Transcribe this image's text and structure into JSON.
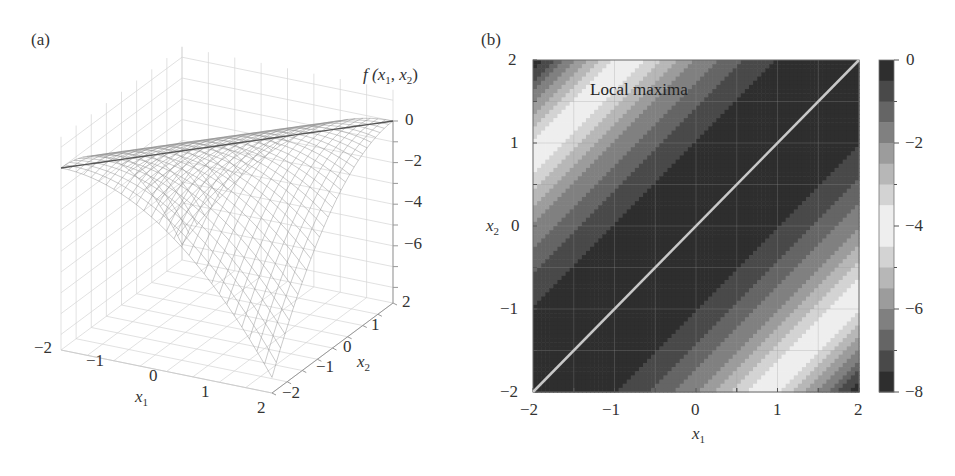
{
  "chart_data": [
    {
      "panel": "(a)",
      "type": "surface3d",
      "title": "",
      "xlabel": "x1",
      "ylabel": "x2",
      "zlabel": "f(x1, x2)",
      "x_ticks": [
        "−2",
        "−1",
        "0",
        "1",
        "2"
      ],
      "y_ticks": [
        "−2",
        "−1",
        "0",
        "1",
        "2"
      ],
      "z_ticks": [
        "0",
        "−2",
        "−4",
        "−6"
      ],
      "xlim": [
        -2,
        2
      ],
      "ylim": [
        -2,
        2
      ],
      "zlim": [
        -8,
        0
      ],
      "grid": true,
      "surface_style": "wireframe mesh, gray",
      "description": "Ridge along x1 = x2 with f = 0; f decreases away from the diagonal, reaching about -8 at corners (x1=2, x2=-2) and (x1=-2, x2=2)"
    },
    {
      "panel": "(b)",
      "type": "contour",
      "title": "",
      "xlabel": "x1",
      "ylabel": "x2",
      "x_ticks": [
        "−2",
        "−1",
        "0",
        "1",
        "2"
      ],
      "y_ticks": [
        "−2",
        "−1",
        "0",
        "1",
        "2"
      ],
      "xlim": [
        -2,
        2
      ],
      "ylim": [
        -2,
        2
      ],
      "grid": true,
      "colorbar": {
        "ticks": [
          "0",
          "−2",
          "−4",
          "−6",
          "−8"
        ],
        "range": [
          -8,
          0
        ],
        "levels": 16,
        "colormap": "gray, dark at 0 and -8, white near -4"
      },
      "annotations": [
        {
          "text": "Local maxima",
          "x": -1.3,
          "y": 1.6
        }
      ],
      "line": {
        "x": [
          -2,
          2
        ],
        "y": [
          -2,
          2
        ],
        "color": "#c8c8c8",
        "label": "local maxima ridge x1 = x2"
      }
    }
  ],
  "labels": {
    "panel_a": "(a)",
    "panel_b": "(b)",
    "f_label_pre": "f (",
    "x": "x",
    "sub1": "1",
    "sub2": "2",
    "comma": ", ",
    "f_label_post": ")",
    "local_maxima": "Local maxima"
  },
  "ticks": {
    "a_x1": [
      "−2",
      "−1",
      "0",
      "1",
      "2"
    ],
    "a_x2": [
      "−2",
      "−1",
      "0",
      "1",
      "2"
    ],
    "a_z": [
      "0",
      "−2",
      "−4",
      "−6"
    ],
    "b_x1": [
      "−2",
      "−1",
      "0",
      "1",
      "2"
    ],
    "b_x2": [
      "2",
      "1",
      "0",
      "−1",
      "−2"
    ],
    "b_cb": [
      "0",
      "−2",
      "−4",
      "−6",
      "−8"
    ]
  }
}
